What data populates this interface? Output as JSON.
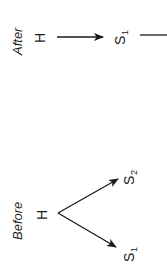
{
  "diagram": {
    "orientation": "rotated-90-ccw",
    "colors": {
      "ink": "#1a1a1a",
      "background": "#ffffff"
    },
    "panels": [
      {
        "id": "after",
        "label": "After",
        "nodes": [
          {
            "id": "H",
            "label": "H",
            "subscript": ""
          },
          {
            "id": "S1",
            "label": "S",
            "subscript": "1"
          }
        ],
        "edges": [
          {
            "from": "H",
            "to": "S1",
            "arrow": true
          },
          {
            "from": "S1",
            "to": "(continues off-image)",
            "arrow": false
          }
        ]
      },
      {
        "id": "before",
        "label": "Before",
        "nodes": [
          {
            "id": "H",
            "label": "H",
            "subscript": ""
          },
          {
            "id": "S2",
            "label": "S",
            "subscript": "2"
          },
          {
            "id": "S1",
            "label": "S",
            "subscript": "1"
          }
        ],
        "edges": [
          {
            "from": "H",
            "to": "S2",
            "arrow": true
          },
          {
            "from": "H",
            "to": "S1",
            "arrow": true
          }
        ]
      }
    ]
  }
}
